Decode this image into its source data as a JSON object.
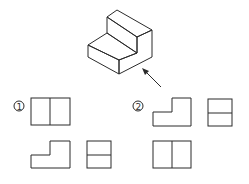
{
  "diagram": {
    "type": "orthographic-projection-question",
    "isometric_view": {
      "description": "stepped block (L-shaped profile) in isometric view",
      "view_arrow": "arrow indicating front viewing direction, from lower right"
    },
    "options": [
      {
        "label": "①",
        "views": {
          "front": "rectangle divided vertically into two halves",
          "top": "L-shaped profile (step on left lower)",
          "side": "rectangle divided horizontally into two halves"
        }
      },
      {
        "label": "②",
        "views": {
          "front": "L-shaped profile (step on left lower)",
          "side": "rectangle divided horizontally into two halves",
          "top": "rectangle divided vertically into two halves"
        }
      }
    ],
    "colors": {
      "line": "#2b2b2b",
      "background": "#ffffff"
    }
  }
}
